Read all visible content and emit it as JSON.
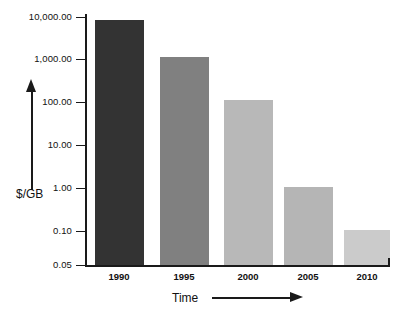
{
  "chart_data": {
    "type": "bar",
    "title": "",
    "subtitle": "",
    "xlabel": "Time",
    "ylabel": "$/GB",
    "categories": [
      "1990",
      "1995",
      "2000",
      "2005",
      "2010"
    ],
    "values": [
      10000.0,
      1100.0,
      110.0,
      1.0,
      0.1
    ],
    "value_labels": [
      "10,000.00",
      "1,100.00",
      "110.00",
      "1.00",
      "0.10"
    ],
    "yscale": "log",
    "ylim": [
      0.05,
      10000
    ],
    "ytick_labels": [
      "10,000.00",
      "1,000.00",
      "100.00",
      "10.00",
      "1.00",
      "0.10",
      "0.05"
    ],
    "ytick_values": [
      10000,
      1000,
      100,
      10,
      1,
      0.1,
      0.05
    ],
    "grid": false,
    "legend": "none",
    "xlabel_arrow": "right-arrow",
    "ylabel_arrow": "up-arrow",
    "bar_colors": [
      "#333333",
      "#808080",
      "#b8b8b8",
      "#b5b5b5",
      "#cbcbcb"
    ],
    "axis_color": "#1a1a1a",
    "background_color": "#ffffff"
  },
  "layout": {
    "bars": [
      {
        "category": "1990",
        "left": 95,
        "width": 49,
        "top": 20,
        "color": "#333333"
      },
      {
        "category": "1995",
        "left": 160,
        "width": 49,
        "top": 57,
        "color": "#808080"
      },
      {
        "category": "2000",
        "left": 224,
        "width": 49,
        "top": 100,
        "color": "#b8b8b8"
      },
      {
        "category": "2005",
        "left": 284,
        "width": 49,
        "top": 187,
        "color": "#b5b5b5"
      },
      {
        "category": "2010",
        "left": 344,
        "width": 46,
        "top": 230,
        "color": "#cbcbcb"
      }
    ],
    "yticks": [
      {
        "label": "10,000.00",
        "y": 17
      },
      {
        "label": "1,000.00",
        "y": 59
      },
      {
        "label": "100.00",
        "y": 102
      },
      {
        "label": "10.00",
        "y": 145
      },
      {
        "label": "1.00",
        "y": 188
      },
      {
        "label": "0.10",
        "y": 231
      },
      {
        "label": "0.05",
        "y": 265
      }
    ],
    "xticks": [
      {
        "label": "1990",
        "center": 119
      },
      {
        "label": "1995",
        "center": 184
      },
      {
        "label": "2000",
        "center": 248
      },
      {
        "label": "2005",
        "center": 308
      },
      {
        "label": "2010",
        "center": 367
      }
    ]
  }
}
